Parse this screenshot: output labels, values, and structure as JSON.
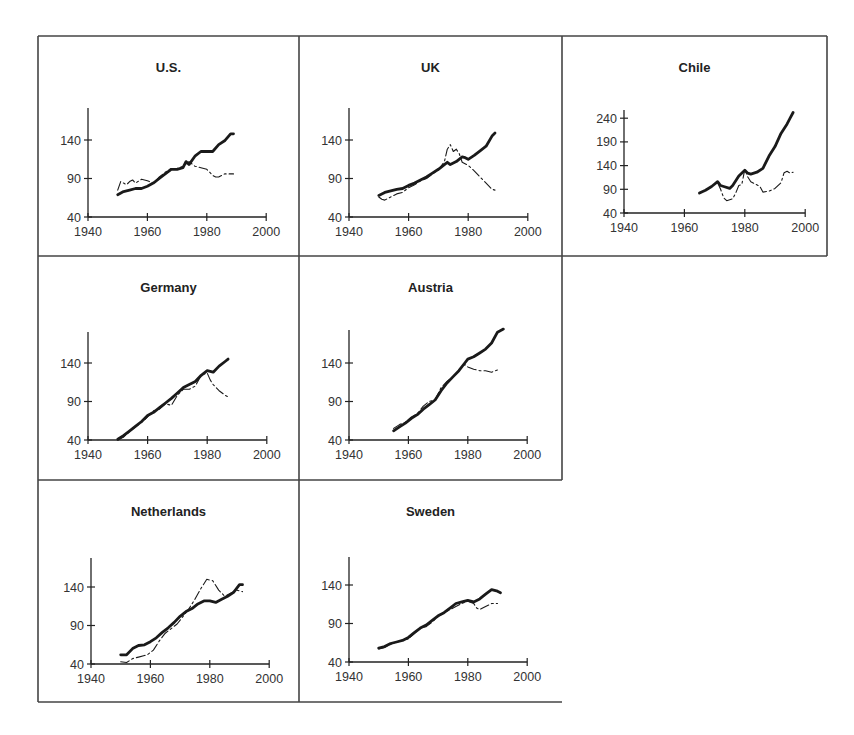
{
  "figure": {
    "frame_color": "#444444",
    "line_color": "#1a1a1a"
  },
  "chart_data": [
    {
      "type": "line",
      "title": "U.S.",
      "xlabel": "",
      "ylabel": "",
      "xlim": [
        1940,
        2000
      ],
      "ylim": [
        40,
        175
      ],
      "xticks": [
        1940,
        1960,
        1980,
        2000
      ],
      "yticks": [
        40,
        90,
        140
      ],
      "grid": false,
      "series": [
        {
          "name": "series-bold",
          "style": "bold",
          "x": [
            1950,
            1952,
            1954,
            1956,
            1958,
            1960,
            1962,
            1964,
            1966,
            1968,
            1970,
            1972,
            1973,
            1974,
            1976,
            1978,
            1980,
            1982,
            1984,
            1986,
            1988,
            1989
          ],
          "y": [
            69,
            73,
            75,
            77,
            77,
            80,
            84,
            90,
            96,
            102,
            102,
            104,
            112,
            108,
            119,
            125,
            125,
            125,
            134,
            139,
            148,
            148
          ]
        },
        {
          "name": "series-thin",
          "style": "thin",
          "x": [
            1950,
            1951,
            1952,
            1953,
            1954,
            1955,
            1956,
            1958,
            1960,
            1962,
            1964,
            1966,
            1968,
            1970,
            1972,
            1974,
            1976,
            1978,
            1980,
            1982,
            1983,
            1984,
            1986,
            1988,
            1989
          ],
          "y": [
            75,
            86,
            84,
            82,
            86,
            88,
            84,
            89,
            87,
            84,
            92,
            98,
            103,
            103,
            106,
            112,
            106,
            104,
            102,
            94,
            92,
            92,
            96,
            96,
            96
          ]
        }
      ]
    },
    {
      "type": "line",
      "title": "UK",
      "xlabel": "",
      "ylabel": "",
      "xlim": [
        1940,
        2000
      ],
      "ylim": [
        40,
        175
      ],
      "xticks": [
        1940,
        1960,
        1980,
        2000
      ],
      "yticks": [
        40,
        90,
        140
      ],
      "grid": false,
      "series": [
        {
          "name": "series-bold",
          "style": "bold",
          "x": [
            1950,
            1952,
            1954,
            1956,
            1958,
            1960,
            1962,
            1964,
            1966,
            1968,
            1970,
            1972,
            1973,
            1974,
            1976,
            1978,
            1979,
            1980,
            1982,
            1984,
            1986,
            1988,
            1989
          ],
          "y": [
            68,
            72,
            74,
            76,
            77,
            81,
            84,
            88,
            92,
            97,
            102,
            108,
            111,
            108,
            112,
            118,
            117,
            115,
            120,
            126,
            132,
            145,
            149
          ]
        },
        {
          "name": "series-thin",
          "style": "thin",
          "x": [
            1950,
            1951,
            1952,
            1954,
            1956,
            1958,
            1960,
            1962,
            1964,
            1966,
            1968,
            1970,
            1972,
            1973,
            1974,
            1975,
            1976,
            1977,
            1978,
            1980,
            1982,
            1984,
            1986,
            1988,
            1989
          ],
          "y": [
            66,
            63,
            62,
            66,
            70,
            72,
            78,
            82,
            87,
            90,
            96,
            101,
            112,
            128,
            134,
            125,
            128,
            122,
            111,
            107,
            100,
            92,
            84,
            76,
            75
          ]
        }
      ]
    },
    {
      "type": "line",
      "title": "Chile",
      "xlabel": "",
      "ylabel": "",
      "xlim": [
        1940,
        2000
      ],
      "ylim": [
        40,
        260
      ],
      "xticks": [
        1940,
        1960,
        1980,
        2000
      ],
      "yticks": [
        40,
        90,
        140,
        190,
        240
      ],
      "grid": false,
      "series": [
        {
          "name": "series-bold",
          "style": "bold",
          "x": [
            1965,
            1967,
            1969,
            1971,
            1972,
            1973,
            1975,
            1976,
            1978,
            1980,
            1981,
            1982,
            1984,
            1986,
            1988,
            1990,
            1992,
            1994,
            1995,
            1996
          ],
          "y": [
            82,
            88,
            96,
            106,
            98,
            96,
            92,
            98,
            118,
            130,
            124,
            122,
            126,
            134,
            160,
            180,
            208,
            228,
            240,
            252
          ]
        },
        {
          "name": "series-thin",
          "style": "thin",
          "x": [
            1971,
            1972,
            1973,
            1974,
            1975,
            1976,
            1977,
            1978,
            1979,
            1980,
            1981,
            1982,
            1985,
            1986,
            1988,
            1990,
            1992,
            1993,
            1994,
            1995,
            1996
          ],
          "y": [
            104,
            90,
            72,
            66,
            68,
            70,
            82,
            98,
            100,
            132,
            116,
            106,
            96,
            84,
            86,
            92,
            104,
            125,
            128,
            124,
            126
          ]
        }
      ]
    },
    {
      "type": "line",
      "title": "Germany",
      "xlabel": "",
      "ylabel": "",
      "xlim": [
        1940,
        2000
      ],
      "ylim": [
        40,
        175
      ],
      "xticks": [
        1940,
        1960,
        1980,
        2000
      ],
      "yticks": [
        40,
        90,
        140
      ],
      "grid": false,
      "series": [
        {
          "name": "series-bold",
          "style": "bold",
          "x": [
            1950,
            1952,
            1954,
            1956,
            1958,
            1960,
            1962,
            1964,
            1966,
            1968,
            1970,
            1972,
            1974,
            1976,
            1978,
            1980,
            1982,
            1984,
            1986,
            1987
          ],
          "y": [
            41,
            46,
            52,
            58,
            64,
            72,
            76,
            82,
            88,
            94,
            101,
            108,
            112,
            116,
            124,
            130,
            128,
            136,
            142,
            145
          ]
        },
        {
          "name": "series-thin",
          "style": "thin",
          "x": [
            1950,
            1952,
            1954,
            1956,
            1958,
            1960,
            1962,
            1964,
            1966,
            1968,
            1970,
            1972,
            1974,
            1976,
            1978,
            1980,
            1981,
            1982,
            1984,
            1986,
            1987
          ],
          "y": [
            40,
            44,
            51,
            57,
            63,
            70,
            78,
            80,
            87,
            85,
            98,
            106,
            106,
            110,
            124,
            127,
            118,
            112,
            104,
            98,
            96
          ]
        }
      ]
    },
    {
      "type": "line",
      "title": "Austria",
      "xlabel": "",
      "ylabel": "",
      "xlim": [
        1940,
        2000
      ],
      "ylim": [
        40,
        175
      ],
      "xticks": [
        1940,
        1960,
        1980,
        2000
      ],
      "yticks": [
        40,
        90,
        140
      ],
      "grid": false,
      "series": [
        {
          "name": "series-bold",
          "style": "bold",
          "x": [
            1955,
            1957,
            1959,
            1961,
            1963,
            1965,
            1967,
            1969,
            1971,
            1973,
            1975,
            1977,
            1979,
            1980,
            1982,
            1984,
            1986,
            1988,
            1990,
            1992
          ],
          "y": [
            52,
            57,
            62,
            68,
            73,
            80,
            86,
            92,
            104,
            114,
            122,
            130,
            140,
            145,
            148,
            153,
            158,
            166,
            180,
            184
          ]
        },
        {
          "name": "series-thin",
          "style": "thin",
          "x": [
            1955,
            1957,
            1959,
            1961,
            1963,
            1965,
            1967,
            1969,
            1971,
            1973,
            1975,
            1977,
            1979,
            1980,
            1982,
            1984,
            1986,
            1988,
            1990
          ],
          "y": [
            55,
            60,
            63,
            70,
            74,
            84,
            90,
            92,
            108,
            116,
            122,
            130,
            138,
            135,
            132,
            130,
            130,
            128,
            131
          ]
        }
      ]
    },
    {
      "type": "line",
      "title": "Netherlands",
      "xlabel": "",
      "ylabel": "",
      "xlim": [
        1940,
        2000
      ],
      "ylim": [
        40,
        175
      ],
      "xticks": [
        1940,
        1960,
        1980,
        2000
      ],
      "yticks": [
        40,
        90,
        140
      ],
      "grid": false,
      "series": [
        {
          "name": "series-bold",
          "style": "bold",
          "x": [
            1950,
            1952,
            1954,
            1956,
            1958,
            1960,
            1962,
            1964,
            1966,
            1968,
            1970,
            1972,
            1974,
            1976,
            1978,
            1980,
            1982,
            1984,
            1986,
            1988,
            1990,
            1991
          ],
          "y": [
            52,
            52,
            60,
            64,
            65,
            69,
            74,
            81,
            87,
            94,
            102,
            108,
            112,
            118,
            122,
            122,
            120,
            124,
            128,
            133,
            143,
            143
          ]
        },
        {
          "name": "series-thin",
          "style": "thin",
          "x": [
            1950,
            1952,
            1954,
            1956,
            1958,
            1959,
            1961,
            1963,
            1965,
            1967,
            1969,
            1971,
            1973,
            1975,
            1977,
            1979,
            1981,
            1983,
            1985,
            1987,
            1989,
            1991
          ],
          "y": [
            43,
            42,
            47,
            49,
            51,
            52,
            58,
            70,
            80,
            86,
            92,
            102,
            112,
            124,
            138,
            150,
            148,
            136,
            128,
            132,
            136,
            134
          ]
        }
      ]
    },
    {
      "type": "line",
      "title": "Sweden",
      "xlabel": "",
      "ylabel": "",
      "xlim": [
        1940,
        2000
      ],
      "ylim": [
        40,
        175
      ],
      "xticks": [
        1940,
        1960,
        1980,
        2000
      ],
      "yticks": [
        40,
        90,
        140
      ],
      "grid": false,
      "series": [
        {
          "name": "series-bold",
          "style": "bold",
          "x": [
            1950,
            1952,
            1954,
            1956,
            1958,
            1960,
            1962,
            1964,
            1966,
            1968,
            1970,
            1972,
            1974,
            1976,
            1978,
            1980,
            1982,
            1984,
            1986,
            1988,
            1990,
            1991
          ],
          "y": [
            58,
            60,
            64,
            66,
            68,
            72,
            78,
            84,
            88,
            94,
            100,
            104,
            110,
            116,
            118,
            120,
            118,
            122,
            128,
            134,
            132,
            130
          ]
        },
        {
          "name": "series-thin",
          "style": "thin",
          "x": [
            1950,
            1952,
            1954,
            1956,
            1958,
            1960,
            1962,
            1964,
            1966,
            1968,
            1970,
            1972,
            1974,
            1976,
            1978,
            1980,
            1982,
            1983,
            1984,
            1986,
            1988,
            1990
          ],
          "y": [
            57,
            59,
            63,
            66,
            68,
            70,
            77,
            84,
            86,
            92,
            99,
            104,
            108,
            112,
            116,
            119,
            116,
            110,
            108,
            112,
            116,
            116
          ]
        }
      ]
    }
  ]
}
